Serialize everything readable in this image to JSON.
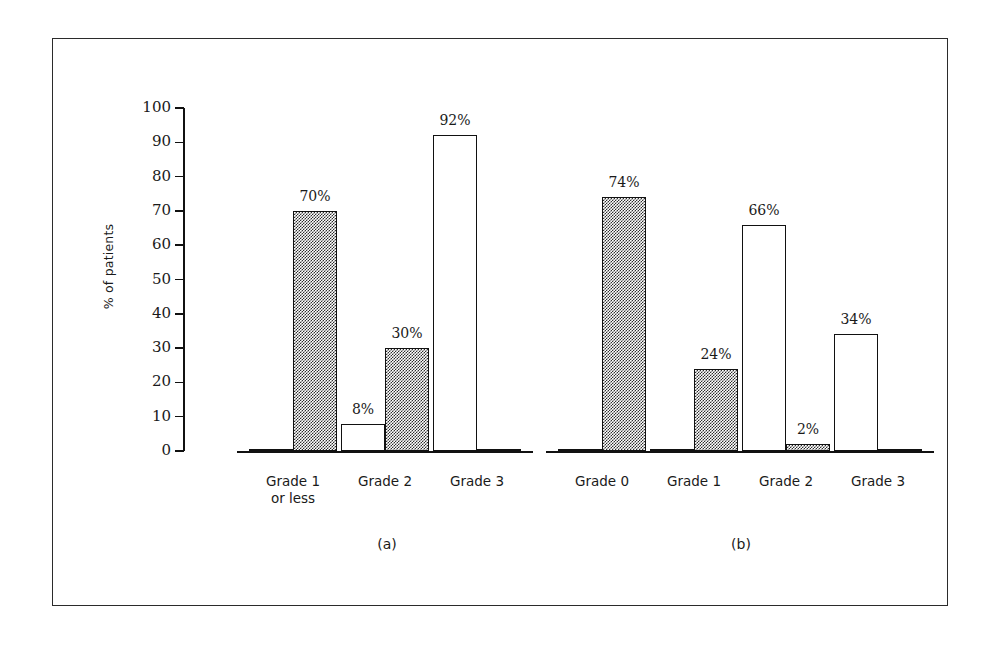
{
  "chart_data": {
    "type": "bar",
    "title": "",
    "subtitle": "",
    "xlabel": "",
    "ylabel": "% of patients",
    "ylim": [
      0,
      100
    ],
    "ytick_labels": [
      "100",
      "90",
      "80",
      "70",
      "60",
      "50",
      "40",
      "30",
      "20",
      "10",
      "0"
    ],
    "ytick_values": [
      100,
      90,
      80,
      70,
      60,
      50,
      40,
      30,
      20,
      10,
      0
    ],
    "grid": false,
    "legend": [],
    "series": [
      {
        "name": "open",
        "style": "white-outline"
      },
      {
        "name": "shaded",
        "style": "checker-fill"
      }
    ],
    "panels": [
      {
        "label": "(a)",
        "categories": [
          "Grade 1\nor less",
          "Grade 2",
          "Grade 3"
        ],
        "series": [
          {
            "name": "open",
            "values": [
              0,
              8,
              92
            ]
          },
          {
            "name": "shaded",
            "values": [
              70,
              30,
              0
            ]
          }
        ],
        "value_labels": [
          {
            "open": "",
            "shaded": "70%"
          },
          {
            "open": "8%",
            "shaded": "30%"
          },
          {
            "open": "92%",
            "shaded": ""
          }
        ]
      },
      {
        "label": "(b)",
        "categories": [
          "Grade 0",
          "Grade 1",
          "Grade 2",
          "Grade 3"
        ],
        "series": [
          {
            "name": "open",
            "values": [
              0,
              0,
              66,
              34
            ]
          },
          {
            "name": "shaded",
            "values": [
              74,
              24,
              2,
              0
            ]
          }
        ],
        "value_labels": [
          {
            "open": "",
            "shaded": "74%"
          },
          {
            "open": "",
            "shaded": "24%"
          },
          {
            "open": "66%",
            "shaded": "2%"
          },
          {
            "open": "34%",
            "shaded": ""
          }
        ]
      }
    ],
    "colors": {
      "line": "#111111",
      "open_fill": "#ffffff",
      "shaded_fill": "#2e2e2e",
      "border": "#2b2b2b",
      "background": "#ffffff"
    }
  }
}
